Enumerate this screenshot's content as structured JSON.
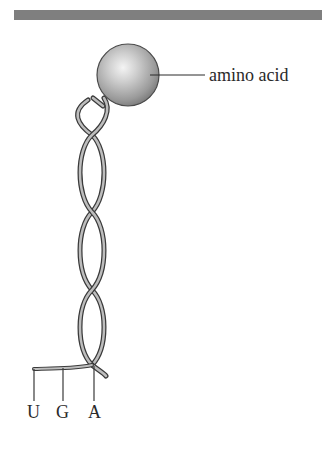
{
  "figure": {
    "title_bar": {
      "color": "#7f7f7f"
    },
    "molecule": "tRNA",
    "amino_acid": {
      "label": "amino acid",
      "sphere_color": "#b0b0b0"
    },
    "anticodon": {
      "bases": [
        {
          "letter": "U"
        },
        {
          "letter": "G"
        },
        {
          "letter": "A"
        }
      ]
    },
    "colors": {
      "strand_fill": "#bdbdbd",
      "strand_edge": "#3a3a3a",
      "text": "#2a2a2a"
    }
  }
}
